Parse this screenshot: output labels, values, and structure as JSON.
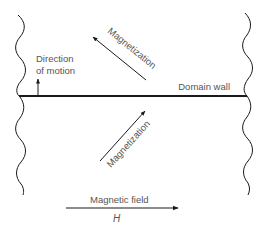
{
  "diagram": {
    "labels": {
      "direction_line1": "Direction",
      "direction_line2": "of motion",
      "magnetization_upper": "Magnetization",
      "magnetization_lower": "Magnetization",
      "domain_wall": "Domain wall",
      "magnetic_field": "Magnetic field",
      "field_symbol": "H"
    },
    "colors": {
      "line": "#1a1a1a",
      "text": "#555555",
      "background": "#ffffff"
    }
  }
}
